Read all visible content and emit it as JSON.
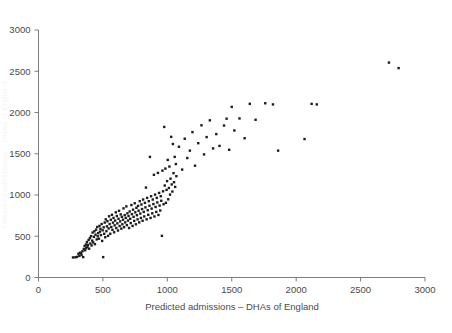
{
  "chart_data": {
    "type": "scatter",
    "title": "",
    "subtitle": "",
    "xlabel": "Predicted admissions – DHAs of England",
    "ylabel": "Observed admissions – DHAs of England",
    "ylabel_visible": false,
    "xlim": [
      0,
      3000
    ],
    "ylim": [
      0,
      3000
    ],
    "xticks": [
      0,
      500,
      1000,
      1500,
      2000,
      2500,
      3000
    ],
    "yticks": [
      0,
      500,
      1000,
      1500,
      2000,
      2500,
      3000
    ],
    "xticklabels": [
      "0",
      "500",
      "1000",
      "1500",
      "2000",
      "2500",
      "3000"
    ],
    "yticklabels": [
      "0",
      "500",
      "1000",
      "1500",
      "2000",
      "2500",
      "3000"
    ],
    "grid": false,
    "legend": null,
    "marker": "square",
    "marker_color": "#1c1c1c",
    "marker_size_px": 2.4,
    "n_points": 198,
    "points": [
      [
        268,
        243
      ],
      [
        286,
        245
      ],
      [
        299,
        250
      ],
      [
        310,
        288
      ],
      [
        317,
        262
      ],
      [
        322,
        300
      ],
      [
        330,
        296
      ],
      [
        334,
        272
      ],
      [
        341,
        318
      ],
      [
        347,
        247
      ],
      [
        352,
        345
      ],
      [
        358,
        381
      ],
      [
        362,
        330
      ],
      [
        368,
        400
      ],
      [
        371,
        356
      ],
      [
        376,
        430
      ],
      [
        380,
        372
      ],
      [
        384,
        395
      ],
      [
        389,
        455
      ],
      [
        393,
        349
      ],
      [
        399,
        478
      ],
      [
        403,
        412
      ],
      [
        408,
        502
      ],
      [
        412,
        388
      ],
      [
        417,
        447
      ],
      [
        420,
        545
      ],
      [
        425,
        425
      ],
      [
        430,
        493
      ],
      [
        434,
        560
      ],
      [
        438,
        404
      ],
      [
        443,
        519
      ],
      [
        447,
        580
      ],
      [
        452,
        462
      ],
      [
        456,
        612
      ],
      [
        460,
        500
      ],
      [
        464,
        538
      ],
      [
        469,
        470
      ],
      [
        473,
        625
      ],
      [
        477,
        556
      ],
      [
        481,
        590
      ],
      [
        485,
        514
      ],
      [
        490,
        648
      ],
      [
        494,
        443
      ],
      [
        498,
        572
      ],
      [
        502,
        247
      ],
      [
        506,
        608
      ],
      [
        510,
        530
      ],
      [
        514,
        666
      ],
      [
        518,
        488
      ],
      [
        522,
        705
      ],
      [
        527,
        562
      ],
      [
        531,
        620
      ],
      [
        535,
        682
      ],
      [
        540,
        505
      ],
      [
        544,
        595
      ],
      [
        548,
        742
      ],
      [
        552,
        648
      ],
      [
        557,
        530
      ],
      [
        561,
        700
      ],
      [
        565,
        612
      ],
      [
        570,
        760
      ],
      [
        574,
        578
      ],
      [
        578,
        665
      ],
      [
        582,
        722
      ],
      [
        587,
        548
      ],
      [
        591,
        632
      ],
      [
        595,
        690
      ],
      [
        600,
        790
      ],
      [
        604,
        600
      ],
      [
        608,
        745
      ],
      [
        612,
        656
      ],
      [
        617,
        570
      ],
      [
        621,
        712
      ],
      [
        625,
        808
      ],
      [
        630,
        624
      ],
      [
        634,
        680
      ],
      [
        638,
        765
      ],
      [
        643,
        592
      ],
      [
        647,
        735
      ],
      [
        651,
        645
      ],
      [
        656,
        700
      ],
      [
        660,
        838
      ],
      [
        664,
        610
      ],
      [
        669,
        756
      ],
      [
        673,
        668
      ],
      [
        677,
        722
      ],
      [
        682,
        862
      ],
      [
        686,
        635
      ],
      [
        690,
        778
      ],
      [
        695,
        690
      ],
      [
        699,
        745
      ],
      [
        703,
        600
      ],
      [
        708,
        800
      ],
      [
        712,
        712
      ],
      [
        716,
        660
      ],
      [
        721,
        878
      ],
      [
        725,
        768
      ],
      [
        730,
        625
      ],
      [
        734,
        822
      ],
      [
        738,
        735
      ],
      [
        743,
        686
      ],
      [
        747,
        900
      ],
      [
        751,
        790
      ],
      [
        756,
        645
      ],
      [
        760,
        845
      ],
      [
        764,
        755
      ],
      [
        769,
        705
      ],
      [
        773,
        868
      ],
      [
        777,
        810
      ],
      [
        782,
        668
      ],
      [
        786,
        925
      ],
      [
        790,
        775
      ],
      [
        795,
        722
      ],
      [
        799,
        885
      ],
      [
        804,
        830
      ],
      [
        808,
        688
      ],
      [
        812,
        945
      ],
      [
        817,
        795
      ],
      [
        821,
        740
      ],
      [
        826,
        905
      ],
      [
        830,
        850
      ],
      [
        834,
        1090
      ],
      [
        839,
        705
      ],
      [
        843,
        965
      ],
      [
        848,
        815
      ],
      [
        852,
        760
      ],
      [
        856,
        925
      ],
      [
        861,
        870
      ],
      [
        865,
        1462
      ],
      [
        870,
        722
      ],
      [
        874,
        985
      ],
      [
        878,
        835
      ],
      [
        883,
        778
      ],
      [
        887,
        945
      ],
      [
        892,
        890
      ],
      [
        896,
        1245
      ],
      [
        900,
        740
      ],
      [
        905,
        1005
      ],
      [
        909,
        855
      ],
      [
        914,
        795
      ],
      [
        918,
        965
      ],
      [
        922,
        910
      ],
      [
        927,
        1268
      ],
      [
        931,
        758
      ],
      [
        936,
        1025
      ],
      [
        940,
        872
      ],
      [
        945,
        812
      ],
      [
        949,
        985
      ],
      [
        953,
        930
      ],
      [
        958,
        505
      ],
      [
        962,
        1295
      ],
      [
        967,
        1045
      ],
      [
        971,
        888
      ],
      [
        976,
        1825
      ],
      [
        980,
        1115
      ],
      [
        985,
        1320
      ],
      [
        989,
        905
      ],
      [
        994,
        1062
      ],
      [
        998,
        1168
      ],
      [
        1003,
        1425
      ],
      [
        1007,
        948
      ],
      [
        1012,
        1085
      ],
      [
        1016,
        1345
      ],
      [
        1021,
        1005
      ],
      [
        1025,
        1198
      ],
      [
        1030,
        1705
      ],
      [
        1034,
        1128
      ],
      [
        1039,
        1042
      ],
      [
        1043,
        1618
      ],
      [
        1048,
        1265
      ],
      [
        1052,
        1155
      ],
      [
        1057,
        1462
      ],
      [
        1061,
        1098
      ],
      [
        1066,
        1375
      ],
      [
        1070,
        1228
      ],
      [
        1090,
        1585
      ],
      [
        1115,
        1308
      ],
      [
        1135,
        1682
      ],
      [
        1155,
        1448
      ],
      [
        1175,
        1538
      ],
      [
        1195,
        1762
      ],
      [
        1215,
        1355
      ],
      [
        1240,
        1628
      ],
      [
        1265,
        1845
      ],
      [
        1285,
        1492
      ],
      [
        1305,
        1702
      ],
      [
        1330,
        1905
      ],
      [
        1355,
        1565
      ],
      [
        1380,
        1738
      ],
      [
        1405,
        1595
      ],
      [
        1440,
        1842
      ],
      [
        1460,
        1925
      ],
      [
        1480,
        1548
      ],
      [
        1500,
        2068
      ],
      [
        1520,
        1782
      ],
      [
        1560,
        1928
      ],
      [
        1600,
        1688
      ],
      [
        1640,
        2105
      ],
      [
        1685,
        1912
      ],
      [
        1760,
        2112
      ],
      [
        1820,
        2098
      ],
      [
        1860,
        1538
      ],
      [
        2065,
        1678
      ],
      [
        2120,
        2105
      ],
      [
        2160,
        2098
      ],
      [
        2720,
        2605
      ],
      [
        2795,
        2538
      ]
    ]
  },
  "axes": {
    "x_axis_name": "x-axis",
    "y_axis_name": "y-axis"
  }
}
